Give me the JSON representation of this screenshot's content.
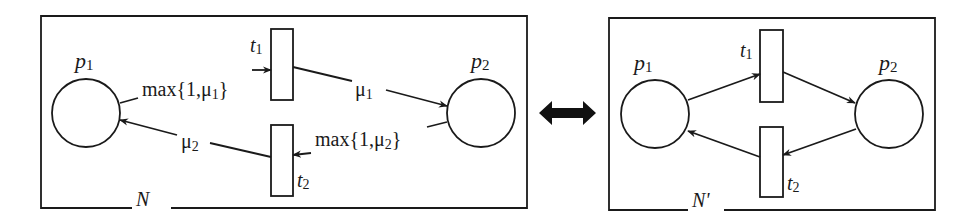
{
  "left_net": {
    "name": "N",
    "places": [
      {
        "id": "p1",
        "label": "p",
        "sub": "1"
      },
      {
        "id": "p2",
        "label": "p",
        "sub": "2"
      }
    ],
    "transitions": [
      {
        "id": "t1",
        "label": "t",
        "sub": "1"
      },
      {
        "id": "t2",
        "label": "t",
        "sub": "2"
      }
    ],
    "arc_labels": {
      "p1_t1": {
        "pre": "max{1,μ",
        "sub": "1",
        "post": "}"
      },
      "t1_p2": {
        "pre": "μ",
        "sub": "1"
      },
      "p2_t2": {
        "pre": "max{1,μ",
        "sub": "2",
        "post": "}"
      },
      "t2_p1": {
        "pre": "μ",
        "sub": "2"
      }
    }
  },
  "equivalence_symbol": "double-arrow",
  "right_net": {
    "name": "N'",
    "places": [
      {
        "id": "p1",
        "label": "p",
        "sub": "1"
      },
      {
        "id": "p2",
        "label": "p",
        "sub": "2"
      }
    ],
    "transitions": [
      {
        "id": "t1",
        "label": "t",
        "sub": "1"
      },
      {
        "id": "t2",
        "label": "t",
        "sub": "2"
      }
    ]
  },
  "colors": {
    "stroke": "#1a1a1a",
    "background": "#ffffff"
  }
}
